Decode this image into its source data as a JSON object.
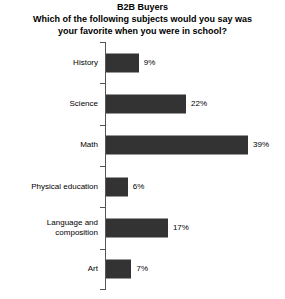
{
  "chart_data": {
    "type": "bar",
    "orientation": "horizontal",
    "title": "B2B Buyers",
    "subtitle_line1": "Which of the following subjects would you say was",
    "subtitle_line2": "your favorite when you were in school?",
    "xlabel": "",
    "ylabel": "",
    "xlim": [
      0,
      45
    ],
    "grid": false,
    "legend": null,
    "value_suffix": "%",
    "bar_color": "#333333",
    "background_color": "#ffffff",
    "text_color": "#000000",
    "axis_color": "#555555",
    "categories": [
      "History",
      "Science",
      "Math",
      "Physical education",
      "Language and\ncomposition",
      "Art"
    ],
    "values": [
      9,
      22,
      39,
      6,
      17,
      7
    ],
    "labels": [
      "9%",
      "22%",
      "39%",
      "6%",
      "17%",
      "7%"
    ]
  }
}
